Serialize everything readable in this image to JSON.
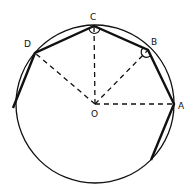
{
  "diagram": {
    "type": "geometry",
    "circle": {
      "cx": 95,
      "cy": 104,
      "r": 79
    },
    "center": {
      "label": "O",
      "x": 95,
      "y": 104
    },
    "points": [
      {
        "label": "A",
        "x": 174,
        "y": 104
      },
      {
        "label": "B",
        "x": 148,
        "y": 50
      },
      {
        "label": "C",
        "x": 94,
        "y": 26
      },
      {
        "label": "D",
        "x": 35,
        "y": 53
      }
    ],
    "unlabeled_points": [
      {
        "x": 13,
        "y": 108
      },
      {
        "x": 151,
        "y": 160
      }
    ],
    "polygon_edges": [
      [
        "left",
        "D"
      ],
      [
        "D",
        "C"
      ],
      [
        "C",
        "B"
      ],
      [
        "B",
        "A"
      ],
      [
        "A",
        "lower-right"
      ]
    ],
    "dashed_radii": [
      "OA",
      "OB",
      "OC",
      "OD"
    ],
    "angle_marks": [
      "C",
      "B"
    ],
    "labels": {
      "A": "A",
      "B": "B",
      "C": "C",
      "D": "D",
      "O": "O"
    },
    "colors": {
      "stroke": "#111111",
      "background": "#ffffff"
    }
  }
}
